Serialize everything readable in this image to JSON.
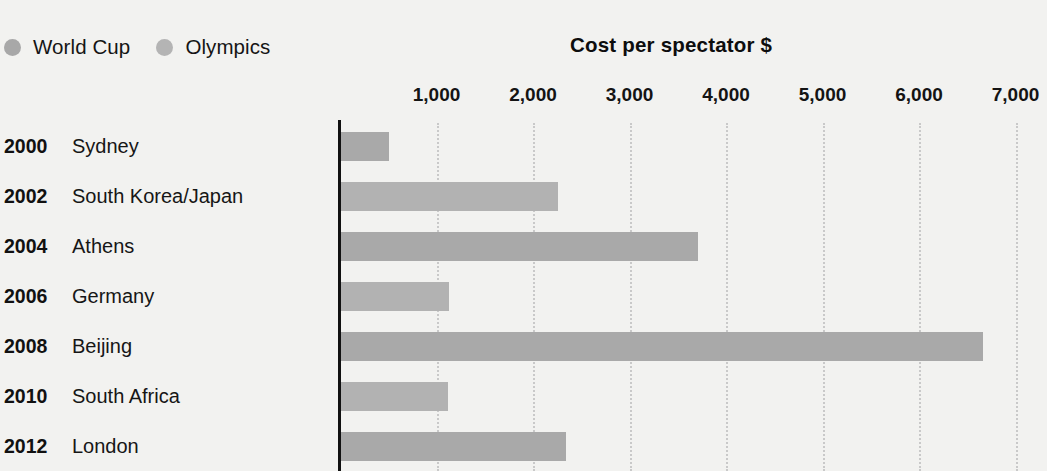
{
  "legend": {
    "items": [
      {
        "label": "World Cup",
        "icon": "legend-dot-icon",
        "color": "#a8a8a8"
      },
      {
        "label": "Olympics",
        "icon": "legend-dot-icon",
        "color": "#b4b4b4"
      }
    ]
  },
  "chart_data": {
    "type": "bar",
    "orientation": "horizontal",
    "title": "Cost per spectator $",
    "xlabel": "",
    "ylabel": "",
    "xlim": [
      0,
      7300
    ],
    "grid": true,
    "legend_position": "top-left",
    "xticks": [
      1000,
      2000,
      3000,
      4000,
      5000,
      6000,
      7000
    ],
    "xtick_labels": [
      "1,000",
      "2,000",
      "3,000",
      "4,000",
      "5,000",
      "6,000",
      "7,000"
    ],
    "categories": [
      "2000 Sydney",
      "2002 South Korea/Japan",
      "2004 Athens",
      "2006 Germany",
      "2008 Beijing",
      "2010 South Africa",
      "2012 London"
    ],
    "rows": [
      {
        "year": "2000",
        "name": "Sydney",
        "value": 500,
        "series": "Olympics",
        "color": "#a9a9a9"
      },
      {
        "year": "2002",
        "name": "South Korea/Japan",
        "value": 2250,
        "series": "World Cup",
        "color": "#b2b2b2"
      },
      {
        "year": "2004",
        "name": "Athens",
        "value": 3700,
        "series": "Olympics",
        "color": "#a9a9a9"
      },
      {
        "year": "2006",
        "name": "Germany",
        "value": 1120,
        "series": "World Cup",
        "color": "#b2b2b2"
      },
      {
        "year": "2008",
        "name": "Beijing",
        "value": 6650,
        "series": "Olympics",
        "color": "#a9a9a9"
      },
      {
        "year": "2010",
        "name": "South Africa",
        "value": 1110,
        "series": "World Cup",
        "color": "#b2b2b2"
      },
      {
        "year": "2012",
        "name": "London",
        "value": 2330,
        "series": "Olympics",
        "color": "#a9a9a9"
      }
    ],
    "series": [
      {
        "name": "World Cup",
        "values": [
          null,
          2250,
          null,
          1120,
          null,
          1110,
          null
        ]
      },
      {
        "name": "Olympics",
        "values": [
          500,
          null,
          3700,
          null,
          6650,
          null,
          2330
        ]
      }
    ]
  }
}
